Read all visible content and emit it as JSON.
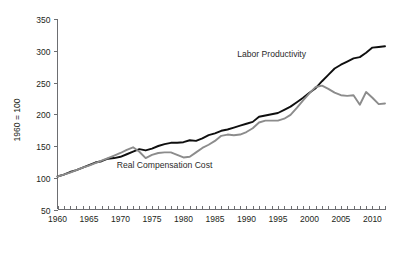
{
  "figure": {
    "caption": "Figure 4.8"
  },
  "chart_data": {
    "type": "line",
    "title": "",
    "xlabel": "",
    "ylabel": "1960 = 100",
    "xlim": [
      1960,
      2012
    ],
    "ylim": [
      50,
      350
    ],
    "grid": false,
    "legend_position": "inline-annotations",
    "ytick_labels": [
      "50",
      "100",
      "150",
      "200",
      "250",
      "300",
      "350"
    ],
    "yticks": [
      50,
      100,
      150,
      200,
      250,
      300,
      350
    ],
    "xtick_labels": [
      "1960",
      "1965",
      "1970",
      "1975",
      "1980",
      "1985",
      "1990",
      "1995",
      "2000",
      "2005",
      "2010"
    ],
    "xticks": [
      1960,
      1965,
      1970,
      1975,
      1980,
      1985,
      1990,
      1995,
      2000,
      2005,
      2010
    ],
    "minor_xtick_step": 1,
    "x": [
      1960,
      1961,
      1962,
      1963,
      1964,
      1965,
      1966,
      1967,
      1968,
      1969,
      1970,
      1971,
      1972,
      1973,
      1974,
      1975,
      1976,
      1977,
      1978,
      1979,
      1980,
      1981,
      1982,
      1983,
      1984,
      1985,
      1986,
      1987,
      1988,
      1989,
      1990,
      1991,
      1992,
      1993,
      1994,
      1995,
      1996,
      1997,
      1998,
      1999,
      2000,
      2001,
      2002,
      2003,
      2004,
      2005,
      2006,
      2007,
      2008,
      2009,
      2010,
      2011,
      2012
    ],
    "series": [
      {
        "name": "Labor Productivity",
        "color": "#0f0f0f",
        "stroke_width": 1.9,
        "annotation": "Labor Productivity",
        "values": [
          102,
          105,
          109,
          112,
          116,
          120,
          124,
          126,
          130,
          131,
          133,
          137,
          141,
          145,
          143,
          146,
          150,
          153,
          155,
          155,
          156,
          159,
          158,
          162,
          167,
          170,
          174,
          176,
          179,
          182,
          185,
          188,
          196,
          198,
          200,
          202,
          207,
          212,
          219,
          226,
          234,
          241,
          252,
          262,
          272,
          278,
          283,
          288,
          290,
          297,
          305,
          306,
          307
        ]
      },
      {
        "name": "Real Compensation Cost",
        "color": "#8c8c8c",
        "stroke_width": 1.9,
        "annotation": "Real Compensation Cost",
        "values": [
          102,
          105,
          108,
          112,
          116,
          119,
          123,
          127,
          131,
          135,
          139,
          144,
          148,
          141,
          131,
          136,
          139,
          140,
          140,
          136,
          132,
          133,
          140,
          147,
          152,
          158,
          166,
          168,
          167,
          168,
          172,
          178,
          187,
          190,
          190,
          190,
          193,
          199,
          210,
          222,
          233,
          243,
          245,
          240,
          234,
          230,
          229,
          230,
          215,
          235,
          226,
          216,
          217
        ]
      }
    ],
    "annotations": [
      {
        "text": "Labor Productivity",
        "x": 1994,
        "y": 290
      },
      {
        "text": "Real Compensation Cost",
        "x": 1977,
        "y": 116
      }
    ]
  }
}
